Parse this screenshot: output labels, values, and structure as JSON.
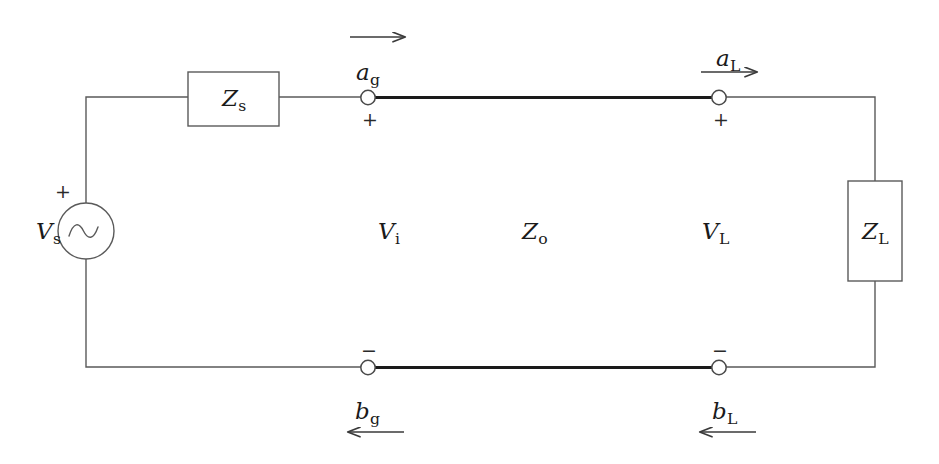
{
  "diagram": {
    "stroke_color": "#4a4a4a",
    "thick_line_color": "#1a1a1a",
    "text_color": "#1a1a1a",
    "background": "#ffffff"
  },
  "labels": {
    "source": {
      "symbol": "V",
      "subscript": "s"
    },
    "source_impedance": {
      "symbol": "Z",
      "subscript": "s"
    },
    "load_impedance": {
      "symbol": "Z",
      "subscript": "L"
    },
    "line_impedance": {
      "symbol": "Z",
      "subscript": "o"
    },
    "input_voltage": {
      "symbol": "V",
      "subscript": "i"
    },
    "load_voltage": {
      "symbol": "V",
      "subscript": "L"
    },
    "incident_wave_generator": {
      "symbol": "a",
      "subscript": "g"
    },
    "incident_wave_load": {
      "symbol": "a",
      "subscript": "L"
    },
    "reflected_wave_generator": {
      "symbol": "b",
      "subscript": "g"
    },
    "reflected_wave_load": {
      "symbol": "b",
      "subscript": "L"
    }
  },
  "polarity": {
    "source_plus": "+",
    "node_ag_plus": "+",
    "node_aL_plus": "+",
    "node_bg_minus": "−",
    "node_bL_minus": "−"
  },
  "arrows": {
    "top_left": {
      "direction": "right",
      "label": ""
    },
    "top_right": {
      "direction": "right",
      "label": "a_L"
    },
    "bottom_left": {
      "direction": "left",
      "label": "b_g"
    },
    "bottom_right": {
      "direction": "left",
      "label": "b_L"
    }
  }
}
